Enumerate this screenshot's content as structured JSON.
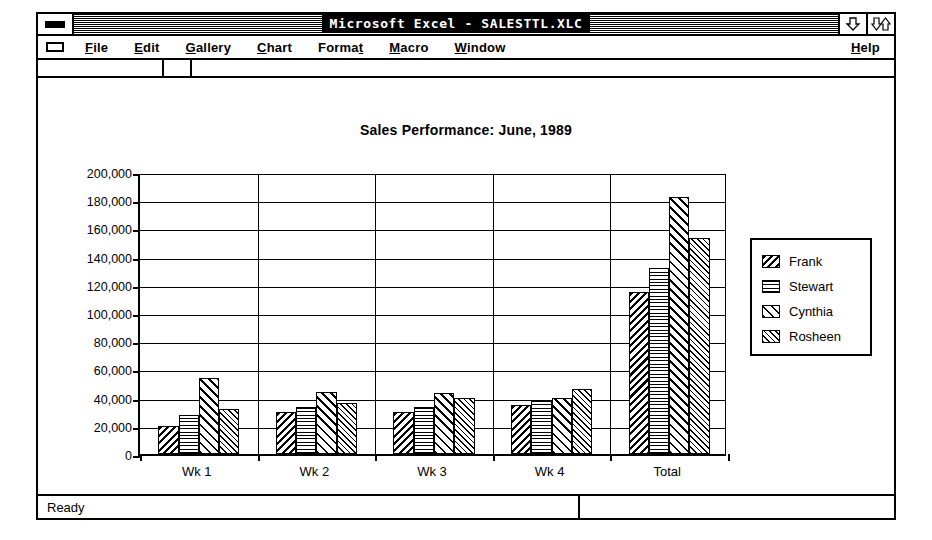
{
  "window": {
    "title": "Microsoft Excel - SALESTTL.XLC",
    "system_menu_icon": "system-menu-icon",
    "minimize_icon": "minimize-down-arrow-icon",
    "maximize_icon": "maximize-double-arrow-icon"
  },
  "menubar": {
    "items": [
      {
        "label": "File",
        "accel": "F"
      },
      {
        "label": "Edit",
        "accel": "E"
      },
      {
        "label": "Gallery",
        "accel": "G"
      },
      {
        "label": "Chart",
        "accel": "C"
      },
      {
        "label": "Format",
        "accel": "t"
      },
      {
        "label": "Macro",
        "accel": "M"
      },
      {
        "label": "Window",
        "accel": "W"
      }
    ],
    "help": {
      "label": "Help",
      "accel": "H"
    }
  },
  "statusbar": {
    "message": "Ready"
  },
  "chart_data": {
    "type": "bar",
    "title": "Sales Performance: June, 1989",
    "xlabel": "",
    "ylabel": "",
    "categories": [
      "Wk 1",
      "Wk 2",
      "Wk 3",
      "Wk 4",
      "Total"
    ],
    "series": [
      {
        "name": "Frank",
        "pattern": "backslash-hatch",
        "values": [
          20000,
          30000,
          30000,
          35000,
          115000
        ]
      },
      {
        "name": "Stewart",
        "pattern": "dot-grid",
        "values": [
          28000,
          33000,
          33000,
          38000,
          132000
        ]
      },
      {
        "name": "Cynthia",
        "pattern": "forwardslash-hatch",
        "values": [
          54000,
          44000,
          43000,
          40000,
          182000
        ]
      },
      {
        "name": "Rosheen",
        "pattern": "cross-hatch",
        "values": [
          32000,
          36000,
          40000,
          46000,
          153000
        ]
      }
    ],
    "ylim": [
      0,
      200000
    ],
    "ytick_step": 20000,
    "ytick_labels": [
      "200,000",
      "180,000",
      "160,000",
      "140,000",
      "120,000",
      "100,000",
      "80,000",
      "60,000",
      "40,000",
      "20,000",
      "0"
    ],
    "grid": true,
    "legend_position": "right"
  }
}
